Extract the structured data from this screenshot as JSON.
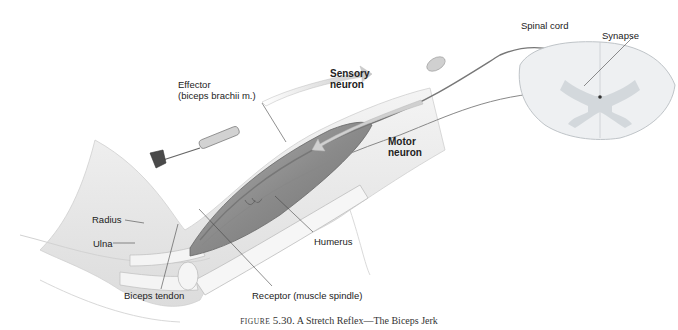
{
  "figure": {
    "prefix": "FIGURE",
    "number": "5.30.",
    "title": "A Stretch Reflex—The Biceps Jerk"
  },
  "labels": {
    "effector_line1": "Effector",
    "effector_line2": "(biceps brachii m.)",
    "sensory_line1": "Sensory",
    "sensory_line2": "neuron",
    "motor_line1": "Motor",
    "motor_line2": "neuron",
    "spinal_cord": "Spinal cord",
    "synapse": "Synapse",
    "radius": "Radius",
    "ulna": "Ulna",
    "humerus": "Humerus",
    "biceps_tendon": "Biceps tendon",
    "receptor": "Receptor (muscle spindle)"
  },
  "colors": {
    "muscle": "#8a8a8a",
    "skin": "#ececec",
    "cord": "#e6eaee",
    "grey_matter": "#cfd4d8",
    "arrow": "#d8d8d8"
  }
}
